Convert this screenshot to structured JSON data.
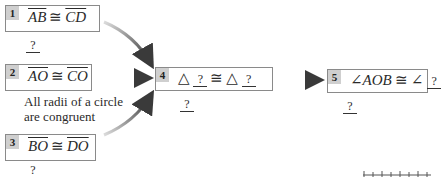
{
  "steps": [
    {
      "number": "1",
      "statement": {
        "left": "AB",
        "relation": "≅",
        "right": "CD"
      },
      "reason": "?"
    },
    {
      "number": "2",
      "statement": {
        "left": "AO",
        "relation": "≅",
        "right": "CO"
      },
      "reason": "All radii of a circle are congruent",
      "reason_line1": "All radii of a circle",
      "reason_line2": "are congruent"
    },
    {
      "number": "3",
      "statement": {
        "left": "BO",
        "relation": "≅",
        "right": "DO"
      },
      "reason": "?"
    },
    {
      "number": "4",
      "statement": {
        "prefix": "△",
        "left_blank": "?",
        "relation": "≅",
        "prefix2": "△",
        "right_blank": "?"
      },
      "reason": "?"
    },
    {
      "number": "5",
      "statement": {
        "left": "∠AOB",
        "relation": "≅",
        "prefix2": "∠",
        "right_blank": "?"
      },
      "reason": "?"
    }
  ],
  "colors": {
    "box_border": "#8a8a8a",
    "number_badge": "#cfcfcf",
    "arrow": "#3a3a3a"
  }
}
